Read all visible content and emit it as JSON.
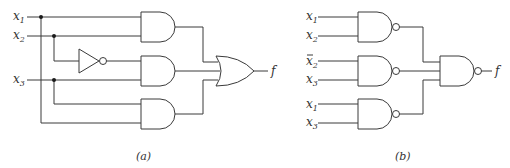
{
  "figure": {
    "panel_a": {
      "caption": "(a)",
      "inputs": [
        {
          "name": "x",
          "sub": "1",
          "complement": false
        },
        {
          "name": "x",
          "sub": "2",
          "complement": false
        },
        {
          "name": "x",
          "sub": "3",
          "complement": false
        }
      ],
      "gates": [
        "NOT",
        "AND",
        "AND",
        "AND",
        "OR"
      ],
      "output": "f"
    },
    "panel_b": {
      "caption": "(b)",
      "inputs": [
        {
          "name": "x",
          "sub": "1",
          "complement": false
        },
        {
          "name": "x",
          "sub": "2",
          "complement": false
        },
        {
          "name": "x",
          "sub": "2",
          "complement": true
        },
        {
          "name": "x",
          "sub": "3",
          "complement": false
        },
        {
          "name": "x",
          "sub": "1",
          "complement": false
        },
        {
          "name": "x",
          "sub": "3",
          "complement": false
        }
      ],
      "gates": [
        "NAND",
        "NAND",
        "NAND",
        "NAND"
      ],
      "output": "f"
    }
  }
}
